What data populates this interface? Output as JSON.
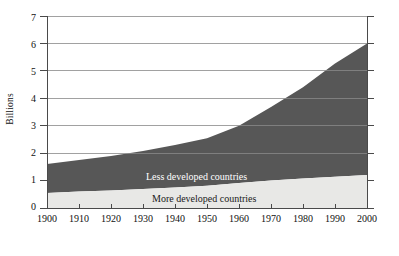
{
  "chart_data": {
    "type": "area",
    "stacked": true,
    "title": "",
    "subtitle": "",
    "xlabel": "",
    "ylabel": "Billions",
    "xlim": [
      1900,
      2000
    ],
    "ylim": [
      0,
      7
    ],
    "grid": true,
    "grid_axis": "y",
    "legend_position": "inline-annotation",
    "x": [
      1900,
      1910,
      1920,
      1930,
      1940,
      1950,
      1960,
      1970,
      1980,
      1990,
      2000
    ],
    "xticks": [
      "1900",
      "1910",
      "1920",
      "1930",
      "1940",
      "1950",
      "1960",
      "1970",
      "1980",
      "1990",
      "2000"
    ],
    "yticks": [
      "0",
      "1",
      "2",
      "3",
      "4",
      "5",
      "6",
      "7"
    ],
    "series": [
      {
        "name": "More developed countries",
        "color": "#e8e8e6",
        "stack_order": 1,
        "values": [
          0.55,
          0.6,
          0.64,
          0.69,
          0.75,
          0.81,
          0.91,
          1.0,
          1.08,
          1.14,
          1.2
        ]
      },
      {
        "name": "Less developed countries",
        "color": "#575757",
        "stack_order": 2,
        "values": [
          1.05,
          1.15,
          1.26,
          1.39,
          1.55,
          1.73,
          2.09,
          2.68,
          3.32,
          4.13,
          4.8
        ]
      }
    ],
    "totals": [
      1.6,
      1.75,
      1.9,
      2.08,
      2.3,
      2.54,
      3.0,
      3.68,
      4.4,
      5.27,
      6.0
    ],
    "annotations": [
      {
        "text": "Less developed countries",
        "x": 1940,
        "y": 2.1,
        "color": "#ffffff"
      },
      {
        "text": "More developed countries",
        "x": 1945,
        "y": 0.33,
        "color": "#1a1a1a"
      }
    ]
  },
  "axis": {
    "y_title": "Billions",
    "y_ticks": [
      "7",
      "6",
      "5",
      "4",
      "3",
      "2",
      "1",
      "0"
    ],
    "x_ticks": [
      "1900",
      "1910",
      "1920",
      "1930",
      "1940",
      "1950",
      "1960",
      "1970",
      "1980",
      "1990",
      "2000"
    ]
  },
  "labels": {
    "less_developed": "Less developed countries",
    "more_developed": "More developed countries"
  },
  "colors": {
    "less_developed": "#575757",
    "more_developed": "#e8e8e6",
    "axis": "#4a4a4a",
    "grid": "#8a8a8a",
    "background": "#ffffff"
  }
}
